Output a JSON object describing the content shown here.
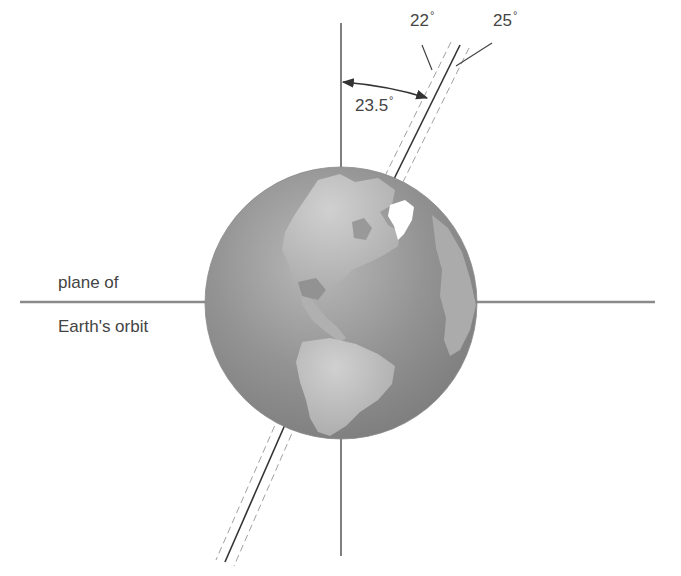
{
  "diagram": {
    "labels": {
      "orbit_plane_line1": "plane of",
      "orbit_plane_line2": "Earth's orbit",
      "tilt_angle": "23.5",
      "tilt_min": "22",
      "tilt_max": "25",
      "degree_symbol": "°"
    },
    "geometry": {
      "globe_center": [
        341,
        303
      ],
      "globe_radius": 136,
      "vertical_axis_x": 341,
      "vertical_axis_y_range": [
        23,
        556
      ],
      "orbit_plane_y": 302,
      "orbit_plane_x_range": [
        20,
        655
      ],
      "tilted_axis_top": [
        460,
        45
      ],
      "tilted_axis_bottom": [
        225,
        562
      ]
    },
    "colors": {
      "background": "#ffffff",
      "line": "#4a4a4a",
      "plane_line": "#8a8a8a",
      "dashed": "#a0a0a0",
      "ocean": "#8c8c8c",
      "land": "#b8b8b8",
      "ice": "#ffffff"
    }
  }
}
